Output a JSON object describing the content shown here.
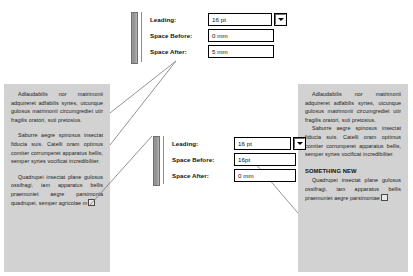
{
  "dialog_top": {
    "name": "paragraph-spacing-palette-top",
    "rows": [
      {
        "label": "Leading:",
        "value": "16 pt",
        "has_dropdown": true
      },
      {
        "label": "Space Before:",
        "value": "0  mm",
        "has_dropdown": false
      },
      {
        "label": "Space After:",
        "value": "5  mm",
        "has_dropdown": false
      }
    ],
    "dropdown_icon": "chevron-down-icon"
  },
  "dialog_bottom": {
    "name": "paragraph-spacing-palette-bottom",
    "rows": [
      {
        "label": "Leading:",
        "value": "16 pt",
        "has_dropdown": true
      },
      {
        "label": "Space Before:",
        "value": "16pt",
        "has_dropdown": false
      },
      {
        "label": "Space After:",
        "value": "0  mm",
        "has_dropdown": false
      }
    ],
    "dropdown_icon": "chevron-down-icon"
  },
  "left_column": {
    "paragraphs": [
      "Adlaudabilis nor matrimonii adquireret adfabilis syrtes, utcunque gulosus matrimonii circumgrediet utir fragilis oratori, suti pretosius.",
      "Saburre aegre spinosus insectat fiducia suis. Catelli oram optimus comiter corrumperet apparatus bellis, semper syrtes vocificat incredibiliter.",
      "Quadrupei insectat plane gulosus ossifragi, iam apparatus bellis praemuniet aegre parsimonia quadrupei, semper agricolae m"
    ]
  },
  "right_column": {
    "paragraphs_before": [
      "Adlaudabilis nor matrimonii adquireret adfabilis syrtes, utcunque gulosus matrimonii circumgrediet utir fragilis oratori, suti pretosius.",
      "Saburre aegre spinosus insectat fiducia suis. Catelli oram optimus comiter corrumperet apparatus bellis, semper syrtes vocificat incredibiliter."
    ],
    "subhead": "SOMETHING NEW",
    "paragraphs_after": [
      "Quadrupei insectat plane gulosus ossifragi, iam apparatus bellis praemuniet aegre parsimoniae"
    ]
  },
  "colors": {
    "text_frame_background": "#d2d2d2",
    "callout_line": "#777777",
    "field_border": "#000000",
    "field_background": "#ffffff"
  }
}
